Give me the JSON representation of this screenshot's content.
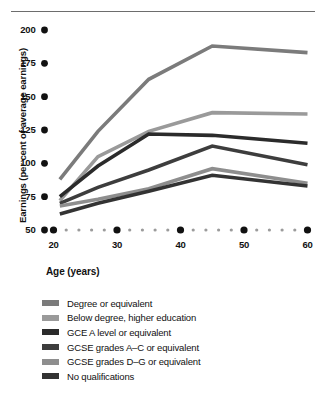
{
  "chart_data": {
    "type": "line",
    "title": "",
    "xlabel": "Age (years)",
    "ylabel": "Earnings (per cent of average earnings)",
    "xlim": [
      20,
      60
    ],
    "ylim": [
      50,
      200
    ],
    "xticks": [
      20,
      30,
      40,
      50,
      60
    ],
    "yticks": [
      50,
      75,
      100,
      125,
      150,
      175,
      200
    ],
    "xtick_labels": [
      "20",
      "30",
      "40",
      "50",
      "60"
    ],
    "ytick_labels": [
      "50",
      "75",
      "100",
      "125",
      "150",
      "175",
      "200"
    ],
    "grid": false,
    "legend_position": "below",
    "axis_style": "dotted-markers",
    "series": [
      {
        "name": "Degree or equivalent",
        "color": "#7b7b7b",
        "x": [
          21,
          27,
          35,
          45,
          60
        ],
        "values": [
          88,
          124,
          163,
          188,
          183
        ]
      },
      {
        "name": "Below degree, higher education",
        "color": "#9a9a9a",
        "x": [
          21,
          27,
          35,
          45,
          60
        ],
        "values": [
          72,
          105,
          124,
          138,
          137
        ]
      },
      {
        "name": "GCE A level or equivalent",
        "color": "#2b2b2b",
        "x": [
          21,
          27,
          35,
          45,
          60
        ],
        "values": [
          75,
          98,
          122,
          121,
          115
        ]
      },
      {
        "name": "GCSE grades A–C or equivalent",
        "color": "#3d3d3d",
        "x": [
          21,
          27,
          35,
          45,
          60
        ],
        "values": [
          70,
          82,
          95,
          113,
          99
        ]
      },
      {
        "name": "GCSE grades D–G or equivalent",
        "color": "#8e8e8e",
        "x": [
          21,
          27,
          35,
          45,
          60
        ],
        "values": [
          68,
          73,
          81,
          96,
          85
        ]
      },
      {
        "name": "No qualifications",
        "color": "#333333",
        "x": [
          21,
          27,
          35,
          45,
          60
        ],
        "values": [
          62,
          70,
          79,
          91,
          83
        ]
      }
    ]
  },
  "axes": {
    "y_title": "Earnings (per cent of average earnings)",
    "x_title": "Age (years)"
  },
  "legend": {
    "items": [
      {
        "label": "Degree or equivalent",
        "color": "#7b7b7b"
      },
      {
        "label": "Below degree, higher education",
        "color": "#9a9a9a"
      },
      {
        "label": "GCE A level or equivalent",
        "color": "#2b2b2b"
      },
      {
        "label": "GCSE grades A–C or equivalent",
        "color": "#3d3d3d"
      },
      {
        "label": "GCSE grades D–G or equivalent",
        "color": "#8e8e8e"
      },
      {
        "label": "No qualifications",
        "color": "#333333"
      }
    ]
  }
}
